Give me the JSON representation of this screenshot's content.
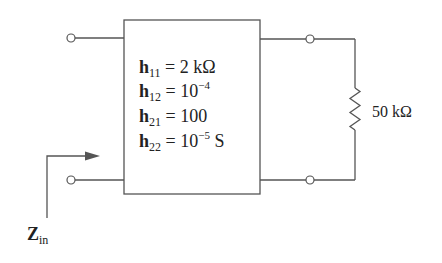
{
  "diagram": {
    "type": "two-port network with load",
    "network": {
      "label": "h-parameter two-port",
      "parameters": [
        {
          "symbol": "h",
          "sub": "11",
          "eq": " = ",
          "value": "2 kΩ",
          "sup": "",
          "suffix": ""
        },
        {
          "symbol": "h",
          "sub": "12",
          "eq": " = ",
          "value": "10",
          "sup": "−4",
          "suffix": ""
        },
        {
          "symbol": "h",
          "sub": "21",
          "eq": " = ",
          "value": "100",
          "sup": "",
          "suffix": ""
        },
        {
          "symbol": "h",
          "sub": "22",
          "eq": " = ",
          "value": "10",
          "sup": "−5",
          "suffix": " S"
        }
      ]
    },
    "load": {
      "label": "50 kΩ"
    },
    "input": {
      "symbol": "Z",
      "sub": "in"
    },
    "colors": {
      "line": "#555555",
      "text": "#222222",
      "background": "#ffffff"
    }
  }
}
